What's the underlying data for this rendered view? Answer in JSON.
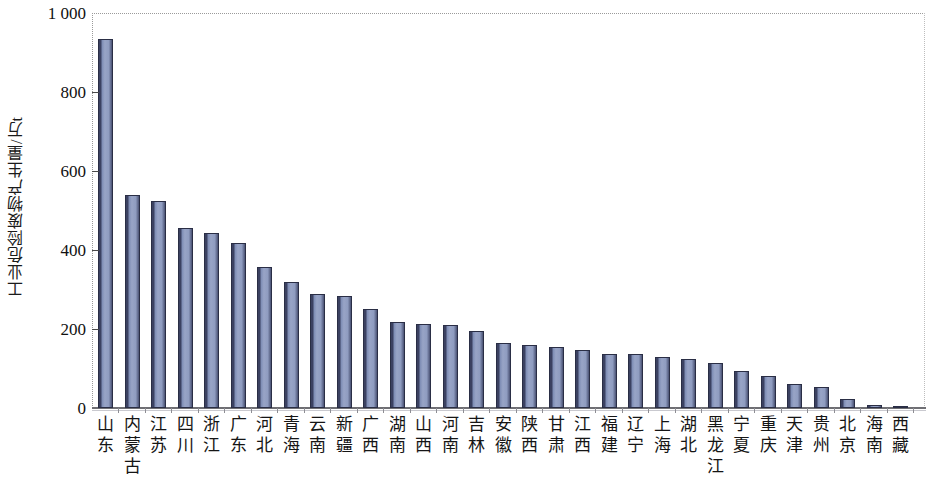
{
  "chart_data": {
    "type": "bar",
    "title": "",
    "subtitle": "",
    "xlabel": "",
    "ylabel": "工业危险废物产生量/万t",
    "ylim": [
      0,
      1000
    ],
    "yticks": [
      "0",
      "200",
      "400",
      "600",
      "800",
      "1 000"
    ],
    "ytick_values": [
      0,
      200,
      400,
      600,
      800,
      1000
    ],
    "grid": false,
    "legend": null,
    "categories": [
      "山东",
      "内蒙古",
      "江苏",
      "四川",
      "浙江",
      "广东",
      "河北",
      "青海",
      "云南",
      "新疆",
      "广西",
      "湖南",
      "山西",
      "河南",
      "吉林",
      "安徽",
      "陕西",
      "甘肃",
      "江西",
      "福建",
      "辽宁",
      "上海",
      "湖北",
      "黑龙江",
      "宁夏",
      "重庆",
      "天津",
      "贵州",
      "北京",
      "海南",
      "西藏"
    ],
    "values": [
      933,
      540,
      523,
      456,
      444,
      417,
      358,
      319,
      289,
      283,
      251,
      217,
      213,
      211,
      196,
      165,
      159,
      155,
      146,
      138,
      136,
      130,
      123,
      115,
      93,
      80,
      61,
      53,
      22,
      8,
      2
    ],
    "bar_color_fill": "#98a4c6",
    "bar_color_edge": "#2a2e45",
    "axis_color": "#6f6f74",
    "background": "#ffffff"
  }
}
